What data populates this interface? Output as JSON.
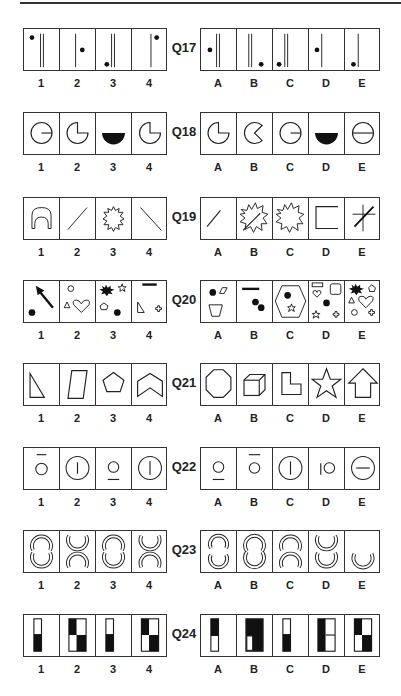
{
  "questions": [
    {
      "id": "Q17",
      "top": 28,
      "left": [
        "1",
        "2",
        "3",
        "4"
      ],
      "right": [
        "A",
        "B",
        "C",
        "D",
        "E"
      ],
      "left_desc": [
        "dot top-left, double line",
        "dot mid-right, single line",
        "dot bottom-left, double line",
        "dot top-right, single line"
      ],
      "right_desc": [
        "dot mid-left, double line",
        "double line, dot bottom-right",
        "dot bottom-left, double line",
        "dot mid-left, single line",
        "dot bottom-left, single line"
      ]
    },
    {
      "id": "Q18",
      "top": 112,
      "left": [
        "1",
        "2",
        "3",
        "4"
      ],
      "right": [
        "A",
        "B",
        "C",
        "D",
        "E"
      ],
      "left_desc": [
        "circle with radius line",
        "circle missing quarter",
        "black semicircle",
        "circle missing quarter"
      ],
      "right_desc": [
        "circle missing quarter",
        "pacman shape",
        "circle with radius line",
        "black semicircle",
        "circle with diameter line"
      ]
    },
    {
      "id": "Q19",
      "top": 197,
      "left": [
        "1",
        "2",
        "3",
        "4"
      ],
      "right": [
        "A",
        "B",
        "C",
        "D",
        "E"
      ],
      "left_desc": [
        "arch outline",
        "forward slash",
        "starburst",
        "back slash"
      ],
      "right_desc": [
        "forward slash",
        "starburst with slash",
        "starburst",
        "open square",
        "cross with slash"
      ]
    },
    {
      "id": "Q20",
      "top": 280,
      "left": [
        "1",
        "2",
        "3",
        "4"
      ],
      "right": [
        "A",
        "B",
        "C",
        "D",
        "E"
      ],
      "left_desc": [
        "arrow and dot",
        "circle triangle heart",
        "burst star pentagon dot",
        "bar triangle cross"
      ],
      "right_desc": [
        "dot parallelogram trapezoid",
        "bar two dots",
        "hexagon dot star",
        "rect square heart dot star cross",
        "burst pentagon triangle heart circle cross"
      ]
    },
    {
      "id": "Q21",
      "top": 363,
      "left": [
        "1",
        "2",
        "3",
        "4"
      ],
      "right": [
        "A",
        "B",
        "C",
        "D",
        "E"
      ],
      "left_desc": [
        "right triangle",
        "parallelogram",
        "pentagon",
        "chevron"
      ],
      "right_desc": [
        "octagon",
        "cube",
        "L-shape",
        "star",
        "arrow up"
      ]
    },
    {
      "id": "Q22",
      "top": 447,
      "left": [
        "1",
        "2",
        "3",
        "4"
      ],
      "right": [
        "A",
        "B",
        "C",
        "D",
        "E"
      ],
      "left_desc": [
        "small circle, bar above",
        "large circle, vertical bar",
        "small circle, bar below",
        "large circle, vertical bar"
      ],
      "right_desc": [
        "small circle, bar below",
        "small circle, bar above",
        "large circle, vertical bar",
        "bar left of small circle",
        "large circle, horizontal bar"
      ]
    },
    {
      "id": "Q23",
      "top": 530,
      "left": [
        "1",
        "2",
        "3",
        "4"
      ],
      "right": [
        "A",
        "B",
        "C",
        "D",
        "E"
      ],
      "left_desc": [
        "joined arcs",
        "facing arcs",
        "joined arcs",
        "facing arcs"
      ],
      "right_desc": [
        "open arcs",
        "joined arcs",
        "stacked arcs",
        "stacked cups",
        "single cup"
      ]
    },
    {
      "id": "Q24",
      "top": 614,
      "left": [
        "1",
        "2",
        "3",
        "4"
      ],
      "right": [
        "A",
        "B",
        "C",
        "D",
        "E"
      ],
      "left_desc": [
        "tall bar bottom black",
        "2x2 checker",
        "tall bar bottom black",
        "2x2 checker"
      ],
      "right_desc": [
        "tall bar top black",
        "block with white bottom-left",
        "tall bar bottom black",
        "left black, right split",
        "checker"
      ]
    }
  ]
}
